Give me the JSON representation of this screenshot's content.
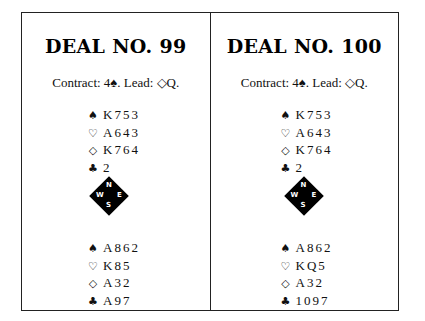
{
  "deals": [
    {
      "title": "DEAL NO. 99",
      "contract_text": "Contract: 4♠. Lead: ◇Q.",
      "north": [
        {
          "suit": "♠",
          "suit_name": "spades",
          "cards": "K753"
        },
        {
          "suit": "♡",
          "suit_name": "hearts",
          "cards": "A643"
        },
        {
          "suit": "◇",
          "suit_name": "diamonds",
          "cards": "K764"
        },
        {
          "suit": "♣",
          "suit_name": "clubs",
          "cards": "2"
        }
      ],
      "compass": {
        "n": "N",
        "s": "S",
        "e": "E",
        "w": "W"
      },
      "south": [
        {
          "suit": "♠",
          "suit_name": "spades",
          "cards": "A862"
        },
        {
          "suit": "♡",
          "suit_name": "hearts",
          "cards": "K85"
        },
        {
          "suit": "◇",
          "suit_name": "diamonds",
          "cards": "A32"
        },
        {
          "suit": "♣",
          "suit_name": "clubs",
          "cards": "A97"
        }
      ]
    },
    {
      "title": "DEAL NO. 100",
      "contract_text": "Contract: 4♠. Lead: ◇Q.",
      "north": [
        {
          "suit": "♠",
          "suit_name": "spades",
          "cards": "K753"
        },
        {
          "suit": "♡",
          "suit_name": "hearts",
          "cards": "A643"
        },
        {
          "suit": "◇",
          "suit_name": "diamonds",
          "cards": "K764"
        },
        {
          "suit": "♣",
          "suit_name": "clubs",
          "cards": "2"
        }
      ],
      "compass": {
        "n": "N",
        "s": "S",
        "e": "E",
        "w": "W"
      },
      "south": [
        {
          "suit": "♠",
          "suit_name": "spades",
          "cards": "A862"
        },
        {
          "suit": "♡",
          "suit_name": "hearts",
          "cards": "KQ5"
        },
        {
          "suit": "◇",
          "suit_name": "diamonds",
          "cards": "A32"
        },
        {
          "suit": "♣",
          "suit_name": "clubs",
          "cards": "1097"
        }
      ]
    }
  ]
}
